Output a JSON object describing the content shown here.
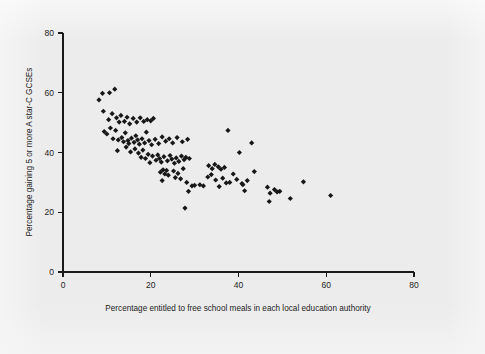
{
  "figure": {
    "background_color": "#ececec",
    "marker_color": "#171717",
    "axis_color": "#1a1a1a"
  },
  "axes": {
    "x": {
      "title": "Percentage entitled to free school meals in each local education authority",
      "ticks": [
        0,
        20,
        40,
        60,
        80
      ],
      "tick_labels": [
        "0",
        "20",
        "40",
        "60",
        "80"
      ],
      "min": 0,
      "max": 80
    },
    "y": {
      "title": "Percentage gaining 5 or more A star-C GCSEs",
      "ticks": [
        0,
        20,
        40,
        60,
        80
      ],
      "tick_labels": [
        "0",
        "20",
        "40",
        "60",
        "80"
      ],
      "min": 0,
      "max": 80
    }
  },
  "chart_data": {
    "type": "scatter",
    "title": "",
    "xlabel": "Percentage entitled to free school meals in each local education authority",
    "ylabel": "Percentage gaining 5 or more A star-C GCSEs",
    "xlim": [
      0,
      80
    ],
    "ylim": [
      0,
      80
    ],
    "xticks": [
      0,
      20,
      40,
      60,
      80
    ],
    "yticks": [
      0,
      20,
      40,
      60,
      80
    ],
    "grid": false,
    "legend": null,
    "marker": "diamond",
    "series": [
      {
        "name": "Local education authorities",
        "points": [
          [
            8.2,
            57.6
          ],
          [
            9.0,
            59.8
          ],
          [
            10.6,
            60.0
          ],
          [
            11.8,
            61.2
          ],
          [
            9.2,
            53.8
          ],
          [
            10.4,
            51.0
          ],
          [
            11.2,
            53.0
          ],
          [
            12.2,
            51.6
          ],
          [
            12.8,
            50.2
          ],
          [
            13.2,
            52.4
          ],
          [
            14.0,
            50.4
          ],
          [
            14.6,
            51.8
          ],
          [
            15.2,
            49.6
          ],
          [
            16.0,
            51.4
          ],
          [
            16.8,
            50.2
          ],
          [
            17.6,
            51.6
          ],
          [
            18.4,
            50.4
          ],
          [
            19.2,
            51.0
          ],
          [
            20.0,
            50.6
          ],
          [
            20.6,
            51.4
          ],
          [
            9.4,
            47.0
          ],
          [
            10.0,
            46.2
          ],
          [
            10.8,
            48.2
          ],
          [
            11.4,
            44.6
          ],
          [
            12.0,
            47.4
          ],
          [
            12.6,
            44.2
          ],
          [
            13.4,
            45.0
          ],
          [
            13.8,
            43.6
          ],
          [
            14.2,
            46.6
          ],
          [
            14.8,
            44.0
          ],
          [
            15.0,
            43.0
          ],
          [
            15.6,
            44.8
          ],
          [
            16.2,
            43.4
          ],
          [
            16.6,
            45.6
          ],
          [
            17.0,
            44.2
          ],
          [
            17.4,
            42.8
          ],
          [
            18.0,
            44.6
          ],
          [
            18.6,
            43.2
          ],
          [
            19.0,
            46.8
          ],
          [
            19.6,
            44.0
          ],
          [
            20.2,
            42.6
          ],
          [
            21.0,
            44.4
          ],
          [
            21.8,
            43.0
          ],
          [
            22.6,
            45.2
          ],
          [
            23.4,
            43.8
          ],
          [
            24.2,
            44.6
          ],
          [
            25.0,
            43.2
          ],
          [
            26.0,
            45.0
          ],
          [
            27.2,
            43.6
          ],
          [
            28.4,
            44.4
          ],
          [
            12.4,
            40.6
          ],
          [
            14.4,
            41.8
          ],
          [
            15.4,
            40.2
          ],
          [
            16.4,
            41.2
          ],
          [
            17.2,
            39.8
          ],
          [
            17.8,
            38.4
          ],
          [
            18.2,
            40.8
          ],
          [
            18.8,
            38.0
          ],
          [
            19.4,
            39.4
          ],
          [
            19.8,
            36.6
          ],
          [
            20.4,
            38.8
          ],
          [
            21.2,
            37.4
          ],
          [
            21.6,
            39.2
          ],
          [
            22.0,
            38.0
          ],
          [
            22.4,
            36.8
          ],
          [
            23.0,
            38.6
          ],
          [
            23.8,
            37.2
          ],
          [
            24.4,
            39.0
          ],
          [
            24.8,
            37.8
          ],
          [
            25.4,
            36.4
          ],
          [
            25.8,
            38.2
          ],
          [
            26.4,
            37.0
          ],
          [
            27.0,
            38.8
          ],
          [
            27.6,
            37.6
          ],
          [
            28.0,
            38.4
          ],
          [
            28.8,
            38.0
          ],
          [
            22.2,
            33.4
          ],
          [
            22.8,
            34.2
          ],
          [
            23.2,
            32.8
          ],
          [
            23.6,
            34.0
          ],
          [
            24.0,
            32.4
          ],
          [
            25.2,
            33.8
          ],
          [
            25.6,
            31.6
          ],
          [
            26.2,
            33.0
          ],
          [
            26.8,
            31.2
          ],
          [
            27.4,
            34.6
          ],
          [
            28.2,
            30.0
          ],
          [
            28.6,
            27.0
          ],
          [
            29.4,
            28.8
          ],
          [
            30.0,
            29.0
          ],
          [
            31.2,
            29.2
          ],
          [
            32.0,
            28.8
          ],
          [
            22.6,
            30.6
          ],
          [
            27.8,
            21.4
          ],
          [
            33.2,
            35.6
          ],
          [
            34.0,
            34.6
          ],
          [
            34.6,
            36.0
          ],
          [
            35.4,
            35.2
          ],
          [
            36.0,
            34.4
          ],
          [
            36.8,
            35.0
          ],
          [
            37.6,
            47.4
          ],
          [
            33.0,
            31.8
          ],
          [
            33.8,
            32.6
          ],
          [
            34.8,
            30.8
          ],
          [
            35.6,
            28.6
          ],
          [
            36.4,
            31.4
          ],
          [
            37.2,
            29.8
          ],
          [
            38.0,
            30.0
          ],
          [
            38.8,
            32.8
          ],
          [
            39.6,
            31.0
          ],
          [
            40.2,
            40.0
          ],
          [
            40.8,
            29.6
          ],
          [
            41.4,
            27.2
          ],
          [
            42.0,
            30.6
          ],
          [
            43.0,
            43.2
          ],
          [
            43.6,
            33.6
          ],
          [
            41.0,
            29.2
          ],
          [
            46.6,
            28.4
          ],
          [
            47.2,
            26.4
          ],
          [
            47.0,
            23.6
          ],
          [
            48.2,
            27.6
          ],
          [
            48.8,
            26.8
          ],
          [
            49.4,
            27.0
          ],
          [
            51.8,
            24.6
          ],
          [
            54.8,
            30.2
          ],
          [
            61.0,
            25.6
          ]
        ]
      }
    ]
  }
}
